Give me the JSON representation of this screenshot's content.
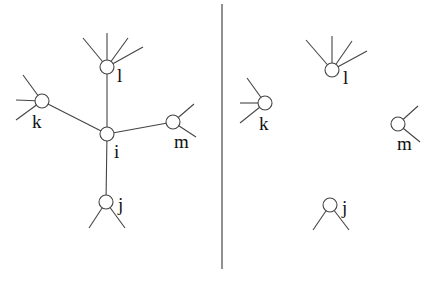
{
  "diagram": {
    "divider": {
      "x": 222,
      "y1": 4,
      "y2": 269
    },
    "left_panel": {
      "nodes": [
        {
          "id": "l",
          "label": "l",
          "cx": 107,
          "cy": 67,
          "label_x": 117,
          "label_y": 82
        },
        {
          "id": "k",
          "label": "k",
          "cx": 42,
          "cy": 101,
          "label_x": 32,
          "label_y": 128
        },
        {
          "id": "i",
          "label": "i",
          "cx": 107,
          "cy": 134,
          "label_x": 114,
          "label_y": 158
        },
        {
          "id": "m",
          "label": "m",
          "cx": 173,
          "cy": 122,
          "label_x": 174,
          "label_y": 148
        },
        {
          "id": "j",
          "label": "j",
          "cx": 106,
          "cy": 202,
          "label_x": 118,
          "label_y": 211
        }
      ],
      "edges": [
        {
          "from": "i",
          "to": "l"
        },
        {
          "from": "i",
          "to": "k"
        },
        {
          "from": "i",
          "to": "m"
        },
        {
          "from": "i",
          "to": "j"
        }
      ],
      "stubs": [
        {
          "node": "l",
          "ends": [
            [
              83,
              38
            ],
            [
              107,
              33
            ],
            [
              128,
              38
            ],
            [
              143,
              47
            ]
          ]
        },
        {
          "node": "k",
          "ends": [
            [
              23,
              75
            ],
            [
              16,
              100
            ],
            [
              16,
              120
            ]
          ]
        },
        {
          "node": "m",
          "ends": [
            [
              194,
              104
            ],
            [
              196,
              137
            ]
          ]
        },
        {
          "node": "j",
          "ends": [
            [
              89,
              228
            ],
            [
              125,
              228
            ]
          ]
        }
      ]
    },
    "right_panel": {
      "nodes": [
        {
          "id": "l",
          "label": "l",
          "cx": 332,
          "cy": 70,
          "label_x": 343,
          "label_y": 84
        },
        {
          "id": "k",
          "label": "k",
          "cx": 265,
          "cy": 103,
          "label_x": 259,
          "label_y": 130
        },
        {
          "id": "m",
          "label": "m",
          "cx": 398,
          "cy": 124,
          "label_x": 397,
          "label_y": 150
        },
        {
          "id": "j",
          "label": "j",
          "cx": 330,
          "cy": 205,
          "label_x": 342,
          "label_y": 214
        }
      ],
      "edges": [],
      "stubs": [
        {
          "node": "l",
          "ends": [
            [
              306,
              40
            ],
            [
              332,
              36
            ],
            [
              352,
              41
            ],
            [
              367,
              51
            ]
          ]
        },
        {
          "node": "k",
          "ends": [
            [
              247,
              78
            ],
            [
              240,
              103
            ],
            [
              240,
              123
            ]
          ]
        },
        {
          "node": "m",
          "ends": [
            [
              418,
              106
            ],
            [
              420,
              142
            ]
          ]
        },
        {
          "node": "j",
          "ends": [
            [
              313,
              230
            ],
            [
              349,
              230
            ]
          ]
        }
      ]
    },
    "node_radius": 7,
    "stroke_color": "#444444"
  }
}
